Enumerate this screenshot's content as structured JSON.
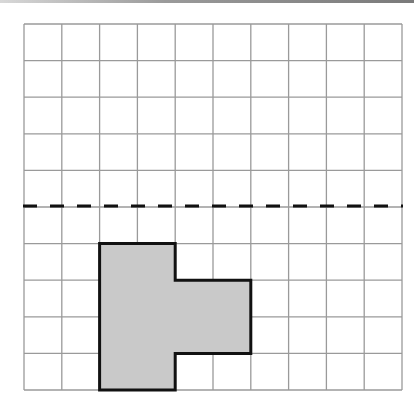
{
  "figure": {
    "type": "grid-reflection-diagram",
    "grid": {
      "columns": 10,
      "rows": 10,
      "origin_x": 24,
      "origin_y": 24,
      "cell_width": 37.8,
      "cell_height": 36.6,
      "line_color": "#9a9a9a"
    },
    "mirror_line": {
      "orientation": "horizontal",
      "row_index": 5,
      "style": "dashed",
      "color": "#111111"
    },
    "shape": {
      "fill": "#c9c9c9",
      "stroke": "#111111",
      "description": "T-shaped polygon (rotated) below the dashed line",
      "vertices_grid": [
        [
          2,
          6
        ],
        [
          4,
          6
        ],
        [
          4,
          7
        ],
        [
          6,
          7
        ],
        [
          6,
          9
        ],
        [
          4,
          9
        ],
        [
          4,
          10
        ],
        [
          2,
          10
        ]
      ]
    }
  }
}
